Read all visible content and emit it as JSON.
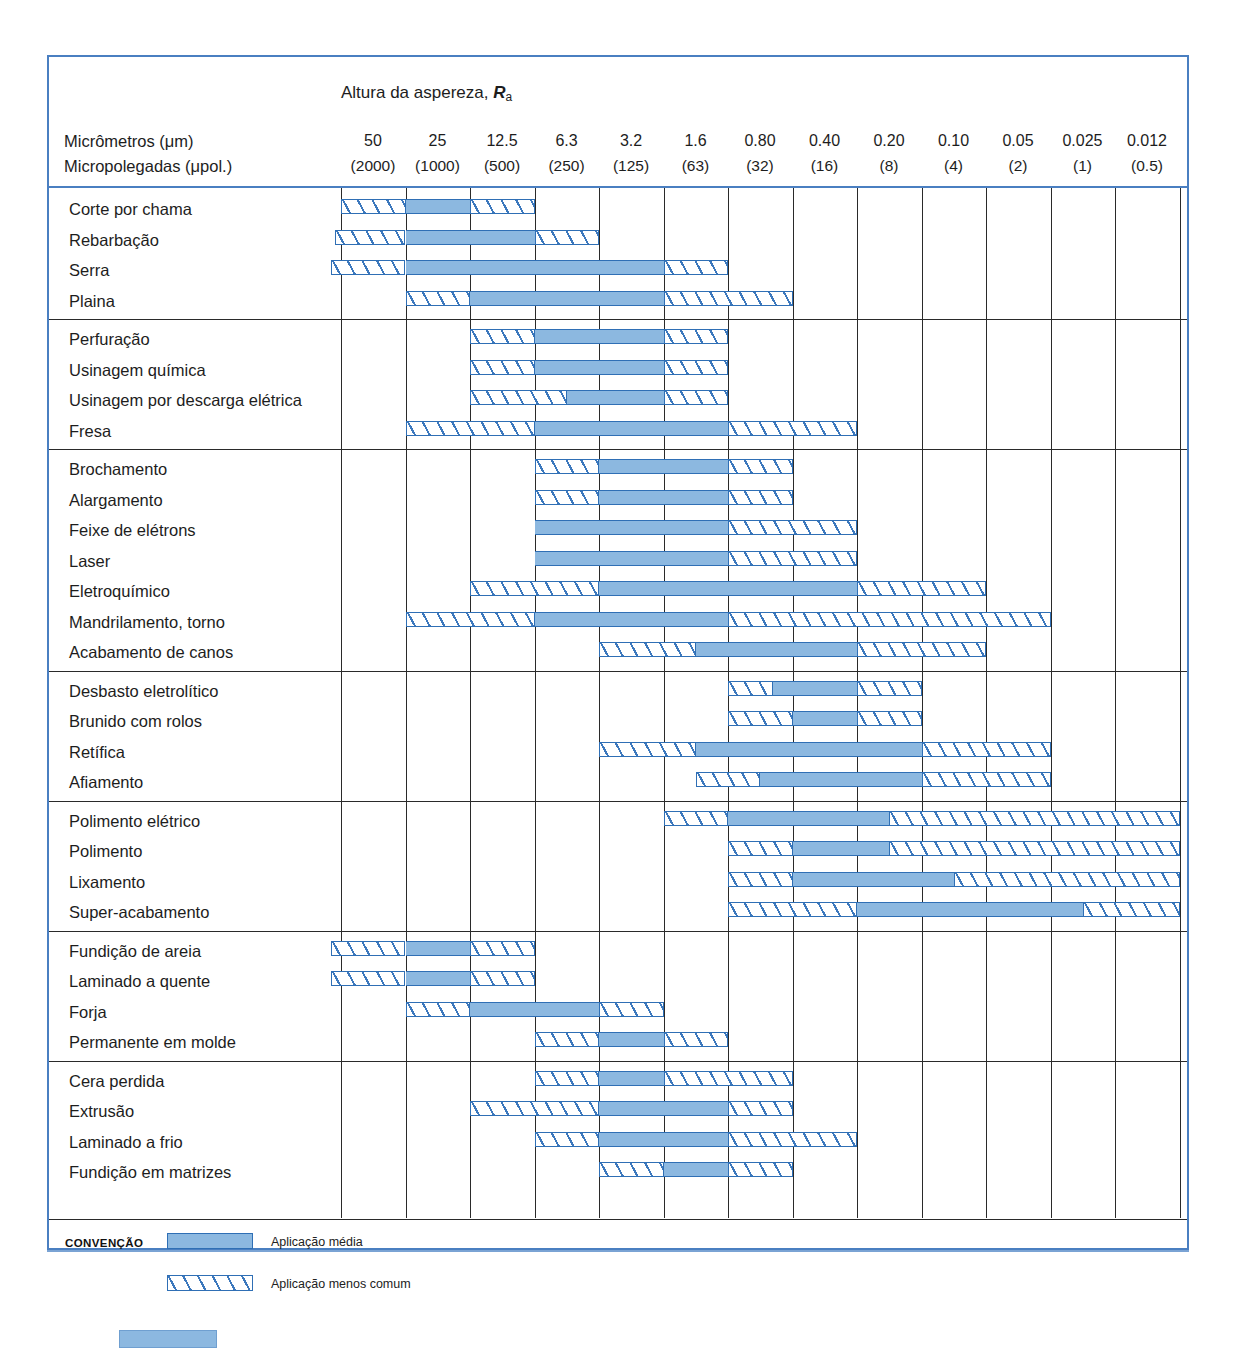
{
  "figure": {
    "title": "Altura da aspereza, Ra",
    "title_main": "Altura da aspereza, ",
    "title_sym": "R",
    "title_sub": "a",
    "unit_rows": [
      {
        "name": "micrometros",
        "label": "Micrômetros (μm)"
      },
      {
        "name": "micropolegadas",
        "label": "Micropolegadas (μpol.)"
      }
    ]
  },
  "legend": {
    "word": "CONVENÇÃO",
    "items": [
      {
        "key": "media",
        "label": "Aplicação média",
        "style": "solid-fill",
        "color": "#8cb8e0"
      },
      {
        "key": "menos_comum",
        "label": "Aplicação menos comum",
        "style": "hatched",
        "color": "#3c78bd"
      }
    ]
  },
  "chart_data": {
    "type": "bar",
    "title": "Altura da aspereza, Ra",
    "xlabel": "Altura da aspereza, Ra",
    "ylabel": "",
    "orientation": "horizontal",
    "scale": "log-reversed",
    "grid": true,
    "legend_position": "bottom-left",
    "x_axis": {
      "micrometros": [
        "50",
        "25",
        "12.5",
        "6.3",
        "3.2",
        "1.6",
        "0.80",
        "0.40",
        "0.20",
        "0.10",
        "0.05",
        "0.025",
        "0.012"
      ],
      "micropolegadas": [
        "(2000)",
        "(1000)",
        "(500)",
        "(250)",
        "(125)",
        "(63)",
        "(32)",
        "(16)",
        "(8)",
        "(4)",
        "(2)",
        "(1)",
        "(0.5)"
      ],
      "n_columns": 13
    },
    "groups": [
      {
        "group_index": 0,
        "rows": [
          {
            "label": "Corte por chama",
            "less_common": [
              [
                0.0,
                1.0
              ],
              [
                2.0,
                3.0
              ]
            ],
            "average": [
              [
                1.0,
                2.0
              ]
            ]
          },
          {
            "label": "Rebarbação",
            "less_common": [
              [
                -0.1,
                1.0
              ],
              [
                3.0,
                4.0
              ]
            ],
            "average": [
              [
                1.0,
                3.0
              ]
            ]
          },
          {
            "label": "Serra",
            "less_common": [
              [
                -0.15,
                1.0
              ],
              [
                5.0,
                6.0
              ]
            ],
            "average": [
              [
                1.0,
                5.0
              ]
            ]
          },
          {
            "label": "Plaina",
            "less_common": [
              [
                1.0,
                2.0
              ],
              [
                5.0,
                7.0
              ]
            ],
            "average": [
              [
                2.0,
                5.0
              ]
            ]
          }
        ]
      },
      {
        "group_index": 1,
        "rows": [
          {
            "label": "Perfuração",
            "less_common": [
              [
                2.0,
                3.0
              ],
              [
                5.0,
                6.0
              ]
            ],
            "average": [
              [
                3.0,
                5.0
              ]
            ]
          },
          {
            "label": "Usinagem química",
            "less_common": [
              [
                2.0,
                3.0
              ],
              [
                5.0,
                6.0
              ]
            ],
            "average": [
              [
                3.0,
                5.0
              ]
            ]
          },
          {
            "label": "Usinagem por descarga elétrica",
            "less_common": [
              [
                2.0,
                3.5
              ],
              [
                5.0,
                6.0
              ]
            ],
            "average": [
              [
                3.5,
                5.0
              ]
            ]
          },
          {
            "label": "Fresa",
            "less_common": [
              [
                1.0,
                3.0
              ],
              [
                6.0,
                8.0
              ]
            ],
            "average": [
              [
                3.0,
                6.0
              ]
            ]
          }
        ]
      },
      {
        "group_index": 2,
        "rows": [
          {
            "label": "Brochamento",
            "less_common": [
              [
                3.0,
                4.0
              ],
              [
                6.0,
                7.0
              ]
            ],
            "average": [
              [
                4.0,
                6.0
              ]
            ]
          },
          {
            "label": "Alargamento",
            "less_common": [
              [
                3.0,
                4.0
              ],
              [
                6.0,
                7.0
              ]
            ],
            "average": [
              [
                4.0,
                6.0
              ]
            ]
          },
          {
            "label": "Feixe de elétrons",
            "less_common": [
              [
                6.0,
                8.0
              ]
            ],
            "average": [
              [
                3.0,
                6.0
              ]
            ]
          },
          {
            "label": "Laser",
            "less_common": [
              [
                6.0,
                8.0
              ]
            ],
            "average": [
              [
                3.0,
                6.0
              ]
            ]
          },
          {
            "label": "Eletroquímico",
            "less_common": [
              [
                2.0,
                4.0
              ],
              [
                8.0,
                10.0
              ]
            ],
            "average": [
              [
                4.0,
                8.0
              ]
            ]
          },
          {
            "label": "Mandrilamento, torno",
            "less_common": [
              [
                1.0,
                3.0
              ],
              [
                6.0,
                11.0
              ]
            ],
            "average": [
              [
                3.0,
                6.0
              ]
            ]
          },
          {
            "label": "Acabamento de canos",
            "less_common": [
              [
                4.0,
                5.5
              ],
              [
                8.0,
                10.0
              ]
            ],
            "average": [
              [
                5.5,
                8.0
              ]
            ]
          }
        ]
      },
      {
        "group_index": 3,
        "rows": [
          {
            "label": "Desbasto eletrolítico",
            "less_common": [
              [
                6.0,
                6.7
              ],
              [
                8.0,
                9.0
              ]
            ],
            "average": [
              [
                6.7,
                8.0
              ]
            ]
          },
          {
            "label": "Brunido com rolos",
            "less_common": [
              [
                6.0,
                7.0
              ],
              [
                8.0,
                9.0
              ]
            ],
            "average": [
              [
                7.0,
                8.0
              ]
            ]
          },
          {
            "label": "Retífica",
            "less_common": [
              [
                4.0,
                5.5
              ],
              [
                9.0,
                11.0
              ]
            ],
            "average": [
              [
                5.5,
                9.0
              ]
            ]
          },
          {
            "label": "Afiamento",
            "less_common": [
              [
                5.5,
                6.5
              ],
              [
                9.0,
                11.0
              ]
            ],
            "average": [
              [
                6.5,
                9.0
              ]
            ]
          }
        ]
      },
      {
        "group_index": 4,
        "rows": [
          {
            "label": "Polimento elétrico",
            "less_common": [
              [
                5.0,
                6.0
              ],
              [
                8.5,
                13.0
              ]
            ],
            "average": [
              [
                6.0,
                8.5
              ]
            ]
          },
          {
            "label": "Polimento",
            "less_common": [
              [
                6.0,
                7.0
              ],
              [
                8.5,
                13.0
              ]
            ],
            "average": [
              [
                7.0,
                8.5
              ]
            ]
          },
          {
            "label": "Lixamento",
            "less_common": [
              [
                6.0,
                7.0
              ],
              [
                9.5,
                13.0
              ]
            ],
            "average": [
              [
                7.0,
                9.5
              ]
            ]
          },
          {
            "label": "Super-acabamento",
            "less_common": [
              [
                6.0,
                8.0
              ],
              [
                11.5,
                13.0
              ]
            ],
            "average": [
              [
                8.0,
                11.5
              ]
            ]
          }
        ]
      },
      {
        "group_index": 5,
        "rows": [
          {
            "label": "Fundição de areia",
            "less_common": [
              [
                -0.15,
                1.0
              ],
              [
                2.0,
                3.0
              ]
            ],
            "average": [
              [
                1.0,
                2.0
              ]
            ]
          },
          {
            "label": "Laminado a quente",
            "less_common": [
              [
                -0.15,
                1.0
              ],
              [
                2.0,
                3.0
              ]
            ],
            "average": [
              [
                1.0,
                2.0
              ]
            ]
          },
          {
            "label": "Forja",
            "less_common": [
              [
                1.0,
                2.0
              ],
              [
                4.0,
                5.0
              ]
            ],
            "average": [
              [
                2.0,
                4.0
              ]
            ]
          },
          {
            "label": "Permanente em molde",
            "less_common": [
              [
                3.0,
                4.0
              ],
              [
                5.0,
                6.0
              ]
            ],
            "average": [
              [
                4.0,
                5.0
              ]
            ]
          }
        ]
      },
      {
        "group_index": 6,
        "rows": [
          {
            "label": "Cera perdida",
            "less_common": [
              [
                3.0,
                4.0
              ],
              [
                5.0,
                7.0
              ]
            ],
            "average": [
              [
                4.0,
                5.0
              ]
            ]
          },
          {
            "label": "Extrusão",
            "less_common": [
              [
                2.0,
                4.0
              ],
              [
                6.0,
                7.0
              ]
            ],
            "average": [
              [
                4.0,
                6.0
              ]
            ]
          },
          {
            "label": "Laminado a frio",
            "less_common": [
              [
                3.0,
                4.0
              ],
              [
                6.0,
                8.0
              ]
            ],
            "average": [
              [
                4.0,
                6.0
              ]
            ]
          },
          {
            "label": "Fundição em matrizes",
            "less_common": [
              [
                4.0,
                5.0
              ],
              [
                6.0,
                7.0
              ]
            ],
            "average": [
              [
                5.0,
                6.0
              ]
            ]
          }
        ]
      }
    ]
  }
}
